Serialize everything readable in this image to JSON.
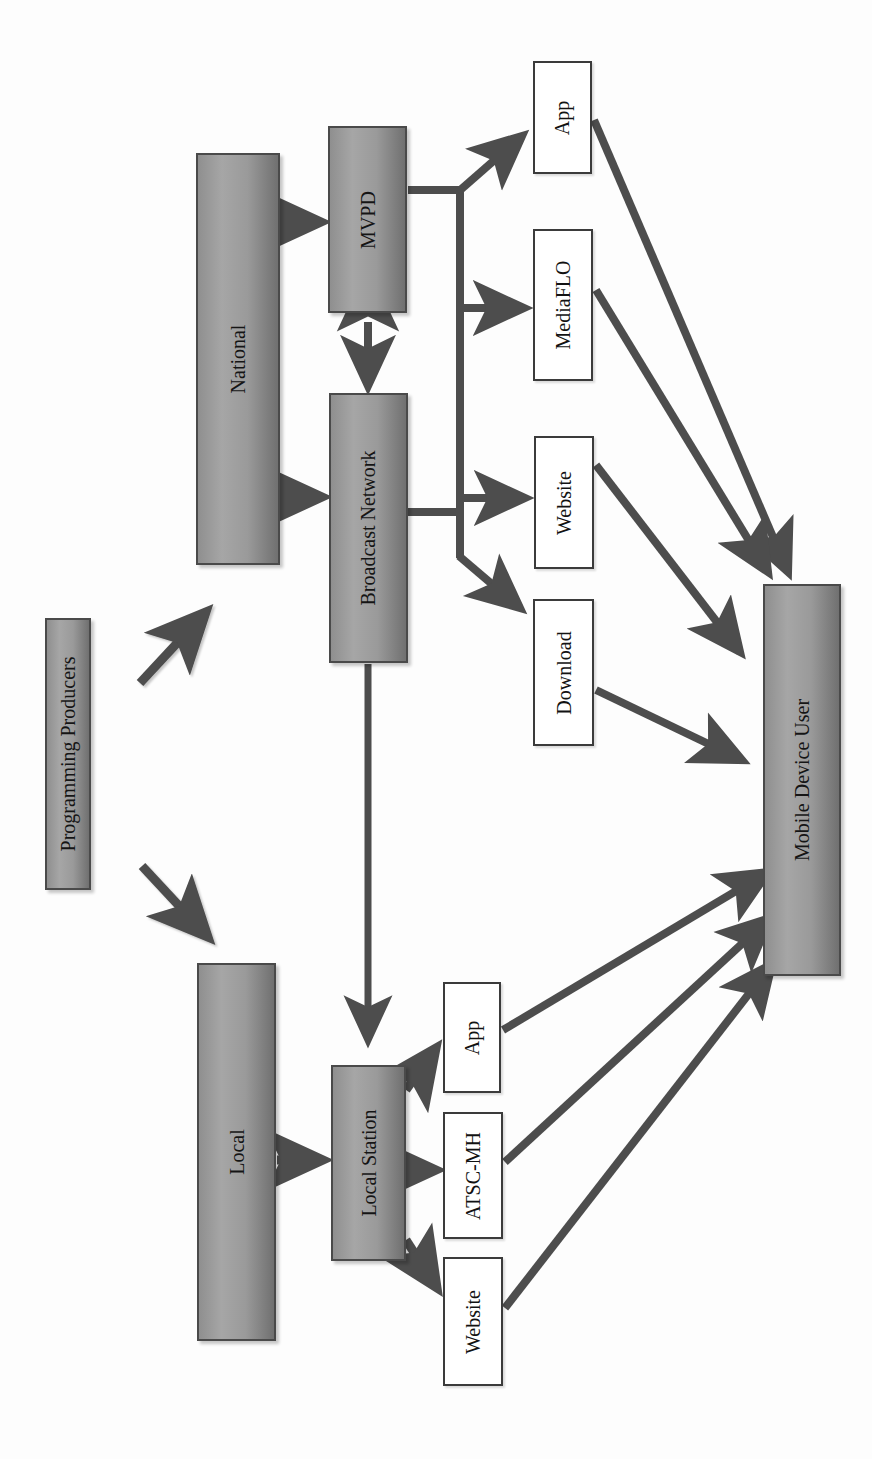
{
  "figure": {
    "caption": "FIGURE 9.1",
    "orientation": "rotated-90-ccw"
  },
  "colors": {
    "entity_fill_light": "#a6a6a6",
    "entity_fill_dark": "#707070",
    "entity_border": "#4a4a4a",
    "outlet_fill": "#ffffff",
    "outlet_border": "#3b3b3b",
    "connector": "#4d4d4d",
    "page_background": "#fdfdfd",
    "text": "#151515"
  },
  "nodes": [
    {
      "id": "programming-producers",
      "label": "Programming Producers",
      "kind": "entity",
      "x": 45,
      "y": 618,
      "w": 46,
      "h": 272
    },
    {
      "id": "national",
      "label": "National",
      "kind": "entity",
      "x": 196,
      "y": 153,
      "w": 84,
      "h": 412
    },
    {
      "id": "local",
      "label": "Local",
      "kind": "entity",
      "x": 197,
      "y": 963,
      "w": 79,
      "h": 378
    },
    {
      "id": "mvpd",
      "label": "MVPD",
      "kind": "entity",
      "x": 328,
      "y": 126,
      "w": 79,
      "h": 187
    },
    {
      "id": "broadcast-network",
      "label": "Broadcast Network",
      "kind": "entity",
      "x": 329,
      "y": 393,
      "w": 79,
      "h": 270
    },
    {
      "id": "local-station",
      "label": "Local Station",
      "kind": "entity",
      "x": 331,
      "y": 1065,
      "w": 75,
      "h": 196
    },
    {
      "id": "mobile-device-user",
      "label": "Mobile Device User",
      "kind": "entity",
      "x": 763,
      "y": 584,
      "w": 78,
      "h": 392
    },
    {
      "id": "app-top",
      "label": "App",
      "kind": "outlet",
      "x": 533,
      "y": 61,
      "w": 59,
      "h": 113
    },
    {
      "id": "mediaflo",
      "label": "MediaFLO",
      "kind": "outlet",
      "x": 533,
      "y": 229,
      "w": 60,
      "h": 152
    },
    {
      "id": "website-top",
      "label": "Website",
      "kind": "outlet",
      "x": 534,
      "y": 436,
      "w": 60,
      "h": 133
    },
    {
      "id": "download",
      "label": "Download",
      "kind": "outlet",
      "x": 533,
      "y": 599,
      "w": 61,
      "h": 147
    },
    {
      "id": "app-bottom",
      "label": "App",
      "kind": "outlet",
      "x": 443,
      "y": 982,
      "w": 58,
      "h": 111
    },
    {
      "id": "atsc-mh",
      "label": "ATSC-MH",
      "kind": "outlet",
      "x": 443,
      "y": 1112,
      "w": 60,
      "h": 127
    },
    {
      "id": "website-bottom",
      "label": "Website",
      "kind": "outlet",
      "x": 443,
      "y": 1257,
      "w": 60,
      "h": 129
    }
  ],
  "connections": [
    {
      "id": "producers-to-national",
      "from": "programming-producers",
      "to": "national",
      "style": "arrow-diagonal"
    },
    {
      "id": "producers-to-local",
      "from": "programming-producers",
      "to": "local",
      "style": "arrow-diagonal"
    },
    {
      "id": "national-to-local",
      "from": "national",
      "to": "local",
      "style": "arrow-straight"
    },
    {
      "id": "national-to-mvpd",
      "from": "national",
      "to": "mvpd",
      "style": "arrow-straight"
    },
    {
      "id": "national-to-broadcast",
      "from": "national",
      "to": "broadcast-network",
      "style": "arrow-straight"
    },
    {
      "id": "mvpd-broadcast-bidirectional",
      "from": "mvpd",
      "to": "broadcast-network",
      "style": "double-arrow"
    },
    {
      "id": "mvpd-to-app",
      "from": "mvpd",
      "to": "app-top",
      "style": "arrow-branch"
    },
    {
      "id": "mvpd-to-mediaflo",
      "from": "mvpd",
      "to": "mediaflo",
      "style": "arrow-branch"
    },
    {
      "id": "broadcast-to-website",
      "from": "broadcast-network",
      "to": "website-top",
      "style": "arrow-branch"
    },
    {
      "id": "broadcast-to-download",
      "from": "broadcast-network",
      "to": "download",
      "style": "arrow-branch"
    },
    {
      "id": "broadcast-to-local-station",
      "from": "broadcast-network",
      "to": "local-station",
      "style": "arrow-straight"
    },
    {
      "id": "local-to-local-station",
      "from": "local",
      "to": "local-station",
      "style": "arrow-straight"
    },
    {
      "id": "station-to-app",
      "from": "local-station",
      "to": "app-bottom",
      "style": "arrow-diagonal"
    },
    {
      "id": "station-to-atsc",
      "from": "local-station",
      "to": "atsc-mh",
      "style": "arrow-straight"
    },
    {
      "id": "station-to-website",
      "from": "local-station",
      "to": "website-bottom",
      "style": "arrow-diagonal"
    },
    {
      "id": "app-to-user",
      "from": "app-top",
      "to": "mobile-device-user",
      "style": "arrow-long-diagonal"
    },
    {
      "id": "mediaflo-to-user",
      "from": "mediaflo",
      "to": "mobile-device-user",
      "style": "arrow-long-diagonal"
    },
    {
      "id": "website-to-user",
      "from": "website-top",
      "to": "mobile-device-user",
      "style": "arrow-long-diagonal"
    },
    {
      "id": "download-to-user",
      "from": "download",
      "to": "mobile-device-user",
      "style": "arrow-long-diagonal"
    },
    {
      "id": "app-bottom-to-user",
      "from": "app-bottom",
      "to": "mobile-device-user",
      "style": "arrow-long-diagonal"
    },
    {
      "id": "atsc-to-user",
      "from": "atsc-mh",
      "to": "mobile-device-user",
      "style": "arrow-long-diagonal"
    },
    {
      "id": "website-bottom-to-user",
      "from": "website-bottom",
      "to": "mobile-device-user",
      "style": "arrow-long-diagonal"
    }
  ]
}
